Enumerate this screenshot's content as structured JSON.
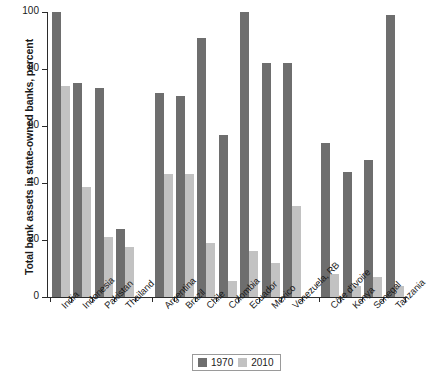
{
  "chart_data": {
    "type": "bar",
    "title": "",
    "subtitle": "",
    "xlabel": "",
    "ylabel": "Total bank assets in state-owned banks, percent",
    "ylim": [
      0,
      100
    ],
    "yticks": [
      0,
      20,
      40,
      60,
      80,
      100
    ],
    "grid": false,
    "legend_position": "bottom-center",
    "legend": [
      "1970",
      "2010"
    ],
    "categories": [
      "India",
      "Indonesia",
      "Pakistan",
      "Thailand",
      "Argentina",
      "Brazil",
      "Chile",
      "Colombia",
      "Ecuador",
      "Mexico",
      "Venezuela, RB",
      "Côte d'Ivoire",
      "Kenya",
      "Senegal",
      "Tanzania"
    ],
    "groups": [
      {
        "name": "Asia",
        "categories": [
          "India",
          "Indonesia",
          "Pakistan",
          "Thailand"
        ]
      },
      {
        "name": "Latin America",
        "categories": [
          "Argentina",
          "Brazil",
          "Chile",
          "Colombia",
          "Ecuador",
          "Mexico",
          "Venezuela, RB"
        ]
      },
      {
        "name": "Africa",
        "categories": [
          "Côte d'Ivoire",
          "Kenya",
          "Senegal",
          "Tanzania"
        ]
      }
    ],
    "series": [
      {
        "name": "1970",
        "color": "#6e6e6e",
        "values": [
          100,
          75,
          73.5,
          24,
          71.5,
          70.5,
          91,
          57,
          100,
          82,
          82,
          54,
          44,
          48,
          99
        ]
      },
      {
        "name": "2010",
        "color": "#c2c2c2",
        "values": [
          74,
          38.5,
          21,
          17.5,
          43,
          43,
          19,
          5.5,
          16,
          12,
          32,
          8,
          4,
          7,
          4
        ]
      }
    ]
  },
  "axis": {
    "y_tick_labels": [
      "0",
      "20",
      "40",
      "60",
      "80",
      "100"
    ]
  },
  "legend": {
    "items": [
      {
        "label": "1970",
        "color": "#6e6e6e"
      },
      {
        "label": "2010",
        "color": "#c2c2c2"
      }
    ]
  }
}
